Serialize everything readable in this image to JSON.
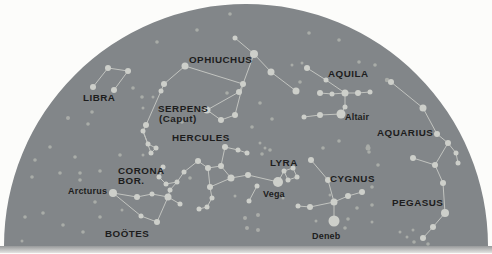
{
  "figure": {
    "type": "sky-dome-constellation-map",
    "width": 492,
    "height": 254,
    "page_background": "#fcfcfa",
    "dome_color": "#828689",
    "star_color": "#cdcfca",
    "faint_star_color": "#a9aca8",
    "line_color": "#c2c4c0",
    "label_color": "#1d1d1d",
    "horizon_band_top": "#97999a",
    "horizon_band_bottom": "#e4e4e2",
    "dome": {
      "cx": 246,
      "cy": 246,
      "r": 242
    }
  },
  "constellations": [
    {
      "id": "libra",
      "labels": [
        {
          "text": "LIBRA",
          "pos": [
            83,
            101
          ]
        }
      ],
      "stars": [
        [
          108,
          68,
          3
        ],
        [
          128,
          71,
          3
        ],
        [
          93,
          87,
          3
        ],
        [
          114,
          90,
          3
        ]
      ],
      "lines": [
        [
          0,
          1
        ],
        [
          0,
          2
        ],
        [
          1,
          3
        ]
      ]
    },
    {
      "id": "serpens-caput",
      "labels": [
        {
          "text": "SERPENS",
          "pos": [
            158,
            112
          ]
        },
        {
          "text": "(Caput)",
          "pos": [
            159,
            122
          ]
        }
      ],
      "stars": [
        [
          185,
          66,
          3.5
        ],
        [
          164,
          84,
          3
        ],
        [
          161,
          91,
          2.5
        ],
        [
          146,
          125,
          3
        ],
        [
          143,
          131,
          2.5
        ],
        [
          148,
          144,
          2.5
        ],
        [
          156,
          148,
          2.5
        ],
        [
          151,
          153,
          2.5
        ]
      ],
      "lines": [
        [
          0,
          1
        ],
        [
          1,
          2
        ],
        [
          2,
          3
        ],
        [
          3,
          4
        ],
        [
          4,
          5
        ],
        [
          5,
          6
        ],
        [
          6,
          7
        ],
        [
          7,
          4
        ]
      ]
    },
    {
      "id": "ophiuchus",
      "labels": [
        {
          "text": "OPHIUCHUS",
          "pos": [
            189,
            63
          ]
        }
      ],
      "stars": [
        [
          235,
          38,
          2.5
        ],
        [
          254,
          54,
          4
        ],
        [
          271,
          72,
          3.5
        ],
        [
          296,
          91,
          3.5
        ],
        [
          243,
          84,
          3
        ],
        [
          239,
          92,
          3
        ],
        [
          207,
          110,
          3.5
        ],
        [
          221,
          120,
          3
        ],
        [
          235,
          115,
          3
        ]
      ],
      "lines": [
        [
          0,
          1
        ],
        [
          1,
          2
        ],
        [
          2,
          3
        ],
        [
          1,
          4
        ],
        [
          4,
          5
        ],
        [
          5,
          6
        ],
        [
          6,
          7
        ],
        [
          7,
          8
        ],
        [
          8,
          4
        ]
      ]
    },
    {
      "id": "hercules",
      "labels": [
        {
          "text": "HERCULES",
          "pos": [
            172,
            141
          ]
        }
      ],
      "stars": [
        [
          225,
          147,
          3
        ],
        [
          238,
          150,
          2.5
        ],
        [
          247,
          153,
          2.5
        ],
        [
          198,
          161,
          3
        ],
        [
          208,
          168,
          3
        ],
        [
          221,
          166,
          3
        ],
        [
          231,
          178,
          3.5
        ],
        [
          210,
          187,
          3
        ],
        [
          212,
          198,
          2.5
        ],
        [
          207,
          207,
          2.5
        ],
        [
          199,
          209,
          2.5
        ],
        [
          248,
          175,
          3
        ]
      ],
      "lines": [
        [
          0,
          1
        ],
        [
          1,
          2
        ],
        [
          0,
          5
        ],
        [
          3,
          4
        ],
        [
          4,
          5
        ],
        [
          5,
          6
        ],
        [
          6,
          7
        ],
        [
          7,
          4
        ],
        [
          7,
          8
        ],
        [
          8,
          9
        ],
        [
          9,
          10
        ],
        [
          6,
          11
        ]
      ]
    },
    {
      "id": "corona-borealis",
      "labels": [
        {
          "text": "CORONA",
          "pos": [
            118,
            174
          ]
        },
        {
          "text": "BOR.",
          "pos": [
            118,
            184
          ]
        }
      ],
      "stars": [
        [
          163,
          167,
          2.5
        ],
        [
          159,
          177,
          2.5
        ],
        [
          166,
          184,
          2.5
        ],
        [
          177,
          182,
          2.5
        ],
        [
          184,
          172,
          2.5
        ]
      ],
      "lines": [
        [
          0,
          1
        ],
        [
          1,
          2
        ],
        [
          2,
          3
        ],
        [
          3,
          4
        ]
      ]
    },
    {
      "id": "bootes",
      "labels": [
        {
          "text": "BOÖTES",
          "pos": [
            105,
            237
          ]
        }
      ],
      "stars": [
        [
          113,
          193,
          4
        ],
        [
          137,
          197,
          3
        ],
        [
          152,
          194,
          2.5
        ],
        [
          168,
          197,
          3.5
        ],
        [
          180,
          204,
          2.5
        ],
        [
          157,
          222,
          3
        ],
        [
          141,
          216,
          2.5
        ],
        [
          170,
          190,
          2.5
        ]
      ],
      "lines": [
        [
          0,
          1
        ],
        [
          1,
          2
        ],
        [
          2,
          3
        ],
        [
          3,
          4
        ],
        [
          3,
          5
        ],
        [
          5,
          6
        ],
        [
          6,
          0
        ],
        [
          7,
          3
        ]
      ]
    },
    {
      "id": "lyra",
      "labels": [
        {
          "text": "LYRA",
          "pos": [
            270,
            166
          ]
        }
      ],
      "stars": [
        [
          278,
          182,
          5
        ],
        [
          284,
          171,
          2.5
        ],
        [
          293,
          168,
          2.5
        ],
        [
          297,
          177,
          2.5
        ],
        [
          288,
          180,
          2.5
        ]
      ],
      "lines": [
        [
          1,
          2
        ],
        [
          2,
          3
        ],
        [
          3,
          4
        ],
        [
          4,
          1
        ],
        [
          0,
          1
        ]
      ]
    },
    {
      "id": "cygnus",
      "labels": [
        {
          "text": "CYGNUS",
          "pos": [
            330,
            182
          ]
        }
      ],
      "stars": [
        [
          311,
          160,
          3
        ],
        [
          328,
          180,
          3
        ],
        [
          334,
          202,
          3.5
        ],
        [
          310,
          207,
          3
        ],
        [
          298,
          206,
          2.5
        ],
        [
          348,
          196,
          3
        ],
        [
          362,
          192,
          3
        ],
        [
          334,
          221,
          5.5
        ]
      ],
      "lines": [
        [
          0,
          1
        ],
        [
          1,
          2
        ],
        [
          2,
          3
        ],
        [
          3,
          4
        ],
        [
          2,
          5
        ],
        [
          5,
          6
        ],
        [
          2,
          7
        ]
      ]
    },
    {
      "id": "aquila",
      "labels": [
        {
          "text": "AQUILA",
          "pos": [
            328,
            77
          ]
        }
      ],
      "stars": [
        [
          307,
          68,
          3
        ],
        [
          326,
          80,
          2.5
        ],
        [
          345,
          93,
          3.5
        ],
        [
          320,
          93,
          3
        ],
        [
          332,
          94,
          2.5
        ],
        [
          358,
          93,
          3
        ],
        [
          370,
          92,
          2.5
        ],
        [
          345,
          107,
          2.5
        ],
        [
          341,
          114,
          4.5
        ],
        [
          320,
          115,
          3
        ],
        [
          304,
          117,
          2.5
        ]
      ],
      "lines": [
        [
          0,
          1
        ],
        [
          1,
          2
        ],
        [
          3,
          4
        ],
        [
          4,
          2
        ],
        [
          2,
          5
        ],
        [
          5,
          6
        ],
        [
          2,
          7
        ],
        [
          7,
          8
        ],
        [
          8,
          9
        ],
        [
          9,
          10
        ]
      ]
    },
    {
      "id": "aquarius",
      "labels": [
        {
          "text": "AQUARIUS",
          "pos": [
            377,
            136
          ]
        }
      ],
      "stars": [
        [
          391,
          82,
          3
        ],
        [
          423,
          108,
          3.5
        ],
        [
          437,
          134,
          3
        ],
        [
          448,
          143,
          3
        ],
        [
          456,
          153,
          2.5
        ],
        [
          458,
          163,
          2.5
        ]
      ],
      "lines": [
        [
          0,
          1
        ],
        [
          1,
          2
        ],
        [
          2,
          3
        ],
        [
          3,
          4
        ],
        [
          4,
          5
        ]
      ]
    },
    {
      "id": "pegasus",
      "labels": [
        {
          "text": "PEGASUS",
          "pos": [
            392,
            206
          ]
        }
      ],
      "stars": [
        [
          413,
          158,
          3
        ],
        [
          435,
          165,
          3
        ],
        [
          443,
          183,
          3
        ],
        [
          445,
          213,
          4
        ],
        [
          433,
          227,
          3
        ],
        [
          423,
          238,
          3
        ]
      ],
      "lines": [
        [
          0,
          1
        ],
        [
          1,
          2
        ],
        [
          2,
          3
        ],
        [
          3,
          4
        ],
        [
          4,
          5
        ]
      ]
    }
  ],
  "star_labels": [
    {
      "id": "arcturus",
      "text": "Arcturus",
      "pos": [
        68,
        194
      ]
    },
    {
      "id": "vega",
      "text": "Vega",
      "pos": [
        263,
        197
      ]
    },
    {
      "id": "altair",
      "text": "Altair",
      "pos": [
        345,
        120
      ]
    },
    {
      "id": "deneb",
      "text": "Deneb",
      "pos": [
        312,
        239
      ]
    }
  ],
  "links": [
    [
      185,
      66,
      243,
      84
    ],
    [
      184,
      172,
      198,
      161
    ],
    [
      170,
      190,
      177,
      182
    ],
    [
      248,
      175,
      278,
      182
    ],
    [
      448,
      143,
      435,
      165
    ],
    [
      257,
      186,
      249,
      201
    ]
  ],
  "link_endpoint_stars": [
    [
      257,
      186,
      2.5
    ],
    [
      249,
      201,
      2.5
    ]
  ],
  "background_stars": [
    [
      92,
      112,
      1.8
    ],
    [
      68,
      118,
      2
    ],
    [
      88,
      124,
      1.8
    ],
    [
      153,
      97,
      1.5
    ],
    [
      143,
      108,
      1.5
    ],
    [
      133,
      88,
      1.8
    ],
    [
      142,
      97,
      1.8
    ],
    [
      182,
      122,
      1.8
    ],
    [
      227,
      93,
      1.8
    ],
    [
      260,
      103,
      1.8
    ],
    [
      272,
      119,
      1.8
    ],
    [
      252,
      127,
      1.8
    ],
    [
      292,
      65,
      1.5
    ],
    [
      302,
      63,
      1.5
    ],
    [
      300,
      82,
      1.8
    ],
    [
      230,
      14,
      1.8
    ],
    [
      197,
      30,
      1.8
    ],
    [
      157,
      42,
      1.8
    ],
    [
      309,
      33,
      1.8
    ],
    [
      339,
      40,
      1.8
    ],
    [
      359,
      62,
      1.8
    ],
    [
      375,
      65,
      1.8
    ],
    [
      387,
      80,
      2.2
    ],
    [
      368,
      146,
      1.8
    ],
    [
      369,
      152,
      1.8
    ],
    [
      339,
      141,
      1.8
    ],
    [
      323,
      148,
      1.8
    ],
    [
      368,
      148,
      2.5
    ],
    [
      378,
      165,
      1.8
    ],
    [
      372,
      187,
      1.8
    ],
    [
      330,
      195,
      1.5
    ],
    [
      357,
      208,
      1.8
    ],
    [
      372,
      205,
      1.8
    ],
    [
      348,
      219,
      1.8
    ],
    [
      345,
      228,
      1.8
    ],
    [
      316,
      221,
      1.5
    ],
    [
      372,
      222,
      1.5
    ],
    [
      283,
      198,
      1.5
    ],
    [
      262,
      154,
      1.8
    ],
    [
      270,
      150,
      1.8
    ],
    [
      260,
      143,
      1.5
    ],
    [
      265,
      148,
      1.5
    ],
    [
      235,
      196,
      1.5
    ],
    [
      245,
      218,
      2
    ],
    [
      258,
      215,
      2
    ],
    [
      247,
      228,
      2
    ],
    [
      258,
      230,
      2
    ],
    [
      400,
      232,
      1.5
    ],
    [
      407,
      237,
      1.5
    ],
    [
      413,
      230,
      1.5
    ],
    [
      414,
      242,
      1.8
    ],
    [
      428,
      244,
      1.8
    ],
    [
      75,
      157,
      1.8
    ],
    [
      120,
      155,
      1.8
    ],
    [
      143,
      155,
      1.5
    ],
    [
      100,
      171,
      1.8
    ],
    [
      80,
      180,
      1.8
    ],
    [
      95,
      202,
      1.8
    ],
    [
      122,
      210,
      1.5
    ],
    [
      190,
      178,
      1.8
    ],
    [
      32,
      177,
      1.8
    ],
    [
      60,
      173,
      1.8
    ],
    [
      80,
      173,
      1.8
    ],
    [
      25,
      217,
      1.8
    ],
    [
      43,
      213,
      1.8
    ],
    [
      63,
      225,
      1.8
    ],
    [
      83,
      232,
      1.8
    ],
    [
      100,
      217,
      1.8
    ],
    [
      22,
      241,
      1.5
    ],
    [
      35,
      160,
      1.8
    ],
    [
      50,
      147,
      1.8
    ]
  ]
}
